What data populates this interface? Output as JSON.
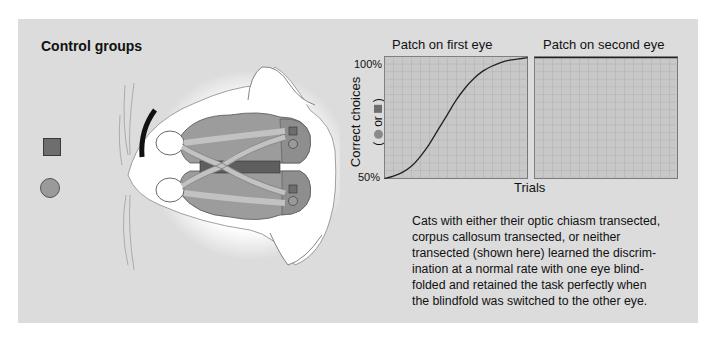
{
  "figure": {
    "title": "Control groups",
    "legend": {
      "square_icon": "dark-gray-square",
      "circle_icon": "gray-circle"
    },
    "colors": {
      "panel_bg": "#dcdcdc",
      "grid_bg": "#c8c8c8",
      "grid_line": "#a4a4a4",
      "brain": "#9c9c9c",
      "corpus_callosum": "#5e5e5e",
      "optic_tract": "#c2c2c2",
      "curve": "#222222"
    }
  },
  "chart_data": [
    {
      "type": "line",
      "title": "Patch on first eye",
      "xlabel": "Trials",
      "ylabel": "Correct choices ( ● or ■ )",
      "ylim": [
        50,
        100
      ],
      "y_ticks": [
        "50%",
        "100%"
      ],
      "grid": true,
      "x": [
        0,
        1,
        2,
        3,
        4,
        5,
        6,
        7,
        8,
        9,
        10,
        11,
        12,
        13,
        14,
        15,
        16
      ],
      "values": [
        50,
        51,
        52.5,
        55,
        59,
        64,
        70,
        76,
        82,
        87,
        91,
        94,
        96,
        97.5,
        98.5,
        99,
        99.5
      ]
    },
    {
      "type": "line",
      "title": "Patch on second eye",
      "xlabel": "Trials",
      "ylabel": "Correct choices ( ● or ■ )",
      "ylim": [
        50,
        100
      ],
      "grid": true,
      "x": [
        0,
        16
      ],
      "values": [
        99.5,
        99.5
      ]
    }
  ],
  "charts": {
    "left_title": "Patch on first eye",
    "right_title": "Patch on second eye",
    "y_label": "Correct choices",
    "y_label_paren_open": "(",
    "y_label_or": "or",
    "y_label_paren_close": ")",
    "y_tick_top": "100%",
    "y_tick_bottom": "50%",
    "x_label": "Trials"
  },
  "caption": {
    "lines": [
      "Cats with either their optic chiasm transected,",
      "corpus callosum transected, or neither",
      "transected (shown here) learned the discrim-",
      "ination at a normal rate with one eye blind-",
      "folded and retained the task perfectly when",
      "the blindfold was switched to the other eye."
    ]
  }
}
